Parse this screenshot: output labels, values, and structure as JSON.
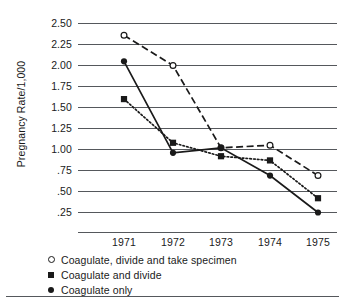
{
  "chart_data": {
    "type": "line",
    "title": "",
    "xlabel": "",
    "ylabel": "Pregnancy Rate/1,000",
    "x": [
      "1971",
      "1972",
      "1973",
      "1974",
      "1975"
    ],
    "categories": [
      "1971",
      "1972",
      "1973",
      "1974",
      "1975"
    ],
    "ylim": [
      0.25,
      2.5
    ],
    "ytick_labels": [
      "2.50",
      "2.25",
      "2.00",
      "1.75",
      "1.50",
      "1.25",
      "1.00",
      ".75",
      ".50",
      ".25"
    ],
    "ytick_values": [
      2.5,
      2.25,
      2.0,
      1.75,
      1.5,
      1.25,
      1.0,
      0.75,
      0.5,
      0.25
    ],
    "grid": true,
    "legend_position": "below-left",
    "series": [
      {
        "name": "Coagulate, divide and take specimen",
        "marker": "open-circle",
        "line_style": "dashed",
        "color": "#1a1a1a",
        "values": [
          2.36,
          2.0,
          1.02,
          1.05,
          0.69
        ]
      },
      {
        "name": "Coagulate and divide",
        "marker": "filled-square",
        "line_style": "dotted",
        "color": "#1a1a1a",
        "values": [
          1.6,
          1.08,
          0.92,
          0.87,
          0.42
        ]
      },
      {
        "name": "Coagulate only",
        "marker": "filled-circle",
        "line_style": "solid",
        "color": "#1a1a1a",
        "values": [
          2.05,
          0.96,
          1.02,
          0.69,
          0.25
        ]
      }
    ]
  },
  "axis": {
    "y_title": "Pregnancy Rate/1,000"
  },
  "legend": {
    "items": [
      {
        "label": "Coagulate, divide and take specimen",
        "marker": "open-circle"
      },
      {
        "label": "Coagulate and divide",
        "marker": "filled-square"
      },
      {
        "label": "Coagulate only",
        "marker": "filled-circle"
      }
    ]
  }
}
